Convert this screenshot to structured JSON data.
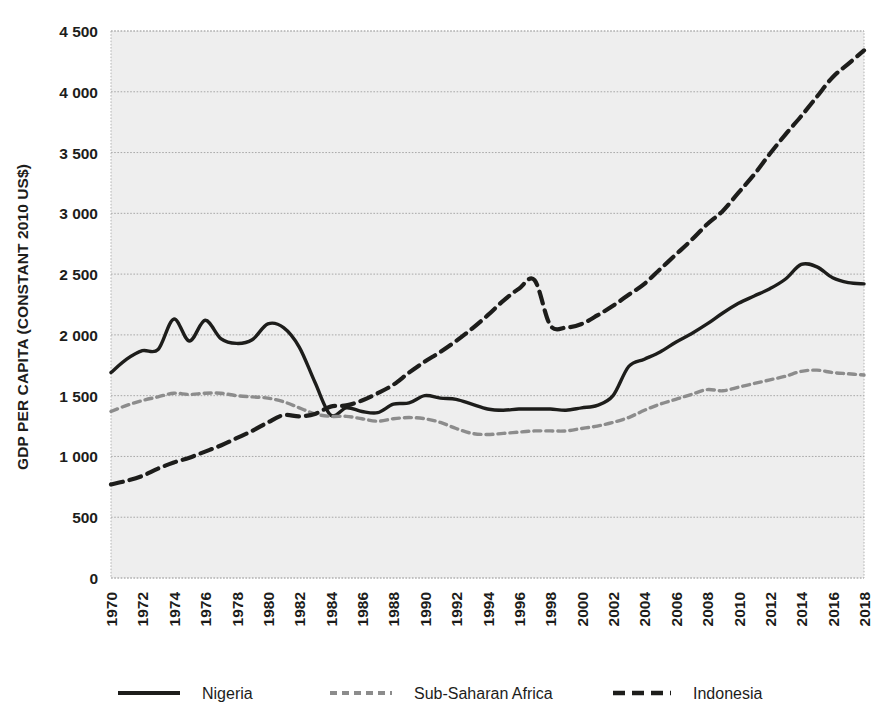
{
  "chart_data": {
    "type": "line",
    "title": "",
    "xlabel": "",
    "ylabel": "GDP PER CAPITA (CONSTANT 2010 US$)",
    "xlim": [
      1970,
      2018
    ],
    "ylim": [
      0,
      4500
    ],
    "grid": true,
    "legend_position": "bottom",
    "y_ticks": [
      "0",
      "500",
      "1 000",
      "1 500",
      "2 000",
      "2 500",
      "3 000",
      "3 500",
      "4 000",
      "4 500"
    ],
    "y_tick_values": [
      0,
      500,
      1000,
      1500,
      2000,
      2500,
      3000,
      3500,
      4000,
      4500
    ],
    "x_ticks": [
      "1970",
      "1972",
      "1974",
      "1976",
      "1978",
      "1980",
      "1982",
      "1984",
      "1986",
      "1988",
      "1990",
      "1992",
      "1994",
      "1996",
      "1998",
      "2000",
      "2002",
      "2004",
      "2006",
      "2008",
      "2010",
      "2012",
      "2014",
      "2016",
      "2018"
    ],
    "x_tick_values": [
      1970,
      1972,
      1974,
      1976,
      1978,
      1980,
      1982,
      1984,
      1986,
      1988,
      1990,
      1992,
      1994,
      1996,
      1998,
      2000,
      2002,
      2004,
      2006,
      2008,
      2010,
      2012,
      2014,
      2016,
      2018
    ],
    "x": [
      1970,
      1971,
      1972,
      1973,
      1974,
      1975,
      1976,
      1977,
      1978,
      1979,
      1980,
      1981,
      1982,
      1983,
      1984,
      1985,
      1986,
      1987,
      1988,
      1989,
      1990,
      1991,
      1992,
      1993,
      1994,
      1995,
      1996,
      1997,
      1998,
      1999,
      2000,
      2001,
      2002,
      2003,
      2004,
      2005,
      2006,
      2007,
      2008,
      2009,
      2010,
      2011,
      2012,
      2013,
      2014,
      2015,
      2016,
      2017,
      2018
    ],
    "series": [
      {
        "name": "Nigeria",
        "color": "#1d1d1b",
        "style": "solid",
        "width": 3.4,
        "values": [
          1690,
          1800,
          1870,
          1880,
          2130,
          1950,
          2120,
          1970,
          1930,
          1960,
          2090,
          2060,
          1900,
          1610,
          1340,
          1400,
          1370,
          1360,
          1430,
          1440,
          1500,
          1480,
          1470,
          1430,
          1390,
          1380,
          1390,
          1390,
          1390,
          1380,
          1400,
          1420,
          1500,
          1740,
          1800,
          1860,
          1940,
          2010,
          2090,
          2180,
          2260,
          2320,
          2380,
          2460,
          2580,
          2560,
          2470,
          2430,
          2420
        ]
      },
      {
        "name": "Sub-Saharan Africa",
        "color": "#8c8c8c",
        "style": "dashed-short",
        "width": 3.4,
        "values": [
          1370,
          1420,
          1460,
          1490,
          1520,
          1510,
          1520,
          1520,
          1500,
          1490,
          1480,
          1450,
          1400,
          1350,
          1330,
          1330,
          1310,
          1290,
          1310,
          1320,
          1310,
          1280,
          1230,
          1190,
          1180,
          1190,
          1200,
          1210,
          1210,
          1210,
          1230,
          1250,
          1280,
          1320,
          1380,
          1430,
          1470,
          1510,
          1550,
          1540,
          1570,
          1600,
          1630,
          1660,
          1700,
          1710,
          1690,
          1680,
          1670
        ]
      },
      {
        "name": "Indonesia",
        "color": "#1d1d1b",
        "style": "dashed-long",
        "width": 4.2,
        "values": [
          770,
          800,
          840,
          900,
          950,
          990,
          1040,
          1090,
          1150,
          1210,
          1280,
          1340,
          1330,
          1350,
          1410,
          1420,
          1460,
          1520,
          1590,
          1690,
          1780,
          1860,
          1950,
          2050,
          2160,
          2280,
          2380,
          2450,
          2080,
          2060,
          2090,
          2160,
          2240,
          2330,
          2420,
          2540,
          2660,
          2780,
          2910,
          3020,
          3170,
          3320,
          3490,
          3650,
          3800,
          3960,
          4120,
          4230,
          4340
        ]
      }
    ]
  },
  "legend": {
    "items": [
      {
        "label": "Nigeria",
        "style": "solid",
        "color": "#1d1d1b"
      },
      {
        "label": "Sub-Saharan Africa",
        "style": "dashed-short",
        "color": "#8c8c8c"
      },
      {
        "label": "Indonesia",
        "style": "dashed-long",
        "color": "#1d1d1b"
      }
    ]
  },
  "colors": {
    "plot_background": "#eeeeee",
    "gridline": "#a8a8a8",
    "nigeria": "#1d1d1b",
    "sub_saharan_africa": "#8c8c8c",
    "indonesia": "#1d1d1b"
  }
}
